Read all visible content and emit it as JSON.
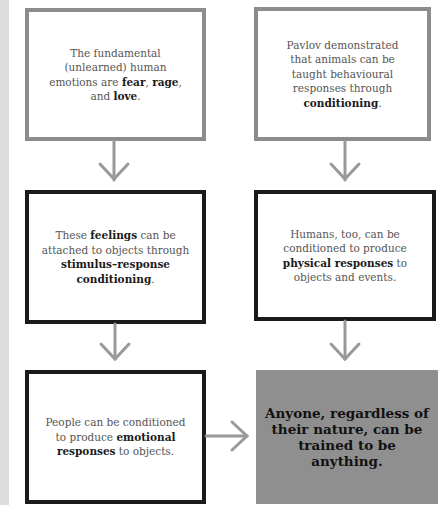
{
  "diagram": {
    "type": "flowchart",
    "colors": {
      "arrow": "#999999",
      "gray_border": "#8c8c8c",
      "black_border": "#1a1a1a",
      "final_box_fill": "#8f8f8f",
      "side_strip": "#dcdcdc"
    },
    "boxes": [
      {
        "id": "b1",
        "parts": [
          {
            "text": "The fundamental (unlearned) human emotions are ",
            "bold": false
          },
          {
            "text": "fear",
            "bold": true
          },
          {
            "text": ", ",
            "bold": false
          },
          {
            "text": "rage",
            "bold": true
          },
          {
            "text": ", and ",
            "bold": false
          },
          {
            "text": "love",
            "bold": true
          },
          {
            "text": ".",
            "bold": false
          }
        ]
      },
      {
        "id": "b2",
        "parts": [
          {
            "text": "Pavlov demonstrated that animals can be taught behavioural responses through ",
            "bold": false
          },
          {
            "text": "conditioning",
            "bold": true
          },
          {
            "text": ".",
            "bold": false
          }
        ]
      },
      {
        "id": "b3",
        "parts": [
          {
            "text": "These ",
            "bold": false
          },
          {
            "text": "feelings",
            "bold": true
          },
          {
            "text": " can be attached to objects through ",
            "bold": false
          },
          {
            "text": "stimulus–response conditioning",
            "bold": true
          },
          {
            "text": ".",
            "bold": false
          }
        ]
      },
      {
        "id": "b4",
        "parts": [
          {
            "text": "Humans, too, can be conditioned to produce ",
            "bold": false
          },
          {
            "text": "physical responses",
            "bold": true
          },
          {
            "text": " to objects and events.",
            "bold": false
          }
        ]
      },
      {
        "id": "b5",
        "parts": [
          {
            "text": "People can be conditioned to produce ",
            "bold": false
          },
          {
            "text": "emotional responses",
            "bold": true
          },
          {
            "text": " to objects.",
            "bold": false
          }
        ]
      },
      {
        "id": "b6",
        "text": "Anyone, regardless of their nature, can be trained to be anything."
      }
    ],
    "arrows": [
      {
        "from": "b1",
        "to": "b3",
        "direction": "down"
      },
      {
        "from": "b2",
        "to": "b4",
        "direction": "down"
      },
      {
        "from": "b3",
        "to": "b5",
        "direction": "down"
      },
      {
        "from": "b4",
        "to": "b6",
        "direction": "down"
      },
      {
        "from": "b5",
        "to": "b6",
        "direction": "right"
      }
    ]
  }
}
